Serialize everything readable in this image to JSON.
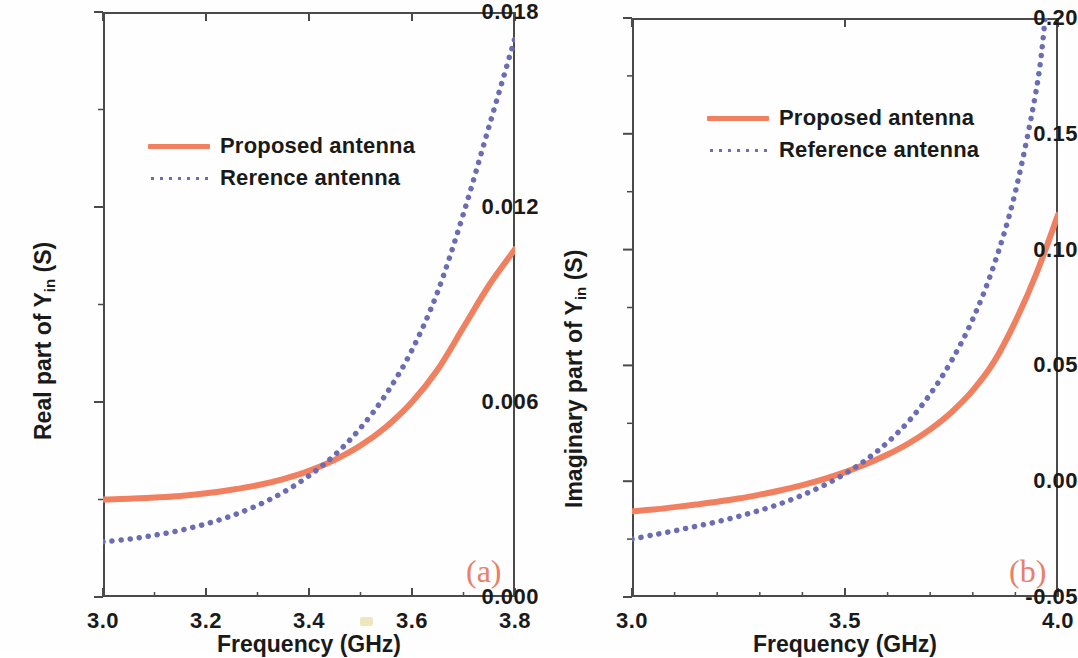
{
  "figure": {
    "background": "#ffffff",
    "series_colors": {
      "proposed": "#F0805F",
      "reference": "#6C6CB4"
    },
    "caption_color": "#E8806A"
  },
  "panels": [
    {
      "id": "a",
      "caption": "(a)",
      "legend": [
        {
          "label": "Proposed antenna",
          "style": "solid",
          "color": "#F0805F"
        },
        {
          "label": "Rerence antenna",
          "style": "dotted",
          "color": "#6C6CB4"
        }
      ]
    },
    {
      "id": "b",
      "caption": "(b)",
      "legend": [
        {
          "label": "Proposed antenna",
          "style": "solid",
          "color": "#F0805F"
        },
        {
          "label": "Reference antenna",
          "style": "dotted",
          "color": "#6C6CB4"
        }
      ]
    }
  ],
  "chart_data": [
    {
      "type": "line",
      "panel": "a",
      "title": "",
      "xlabel": "Frequency (GHz)",
      "ylabel": "Real part of Yin (S)",
      "ylabel_main": "Real part of Y",
      "ylabel_sub": "in",
      "ylabel_unit": " (S)",
      "xlim": [
        3.0,
        3.8
      ],
      "ylim": [
        0.0,
        0.018
      ],
      "xticks": [
        3.0,
        3.2,
        3.4,
        3.6,
        3.8
      ],
      "xticklabels": [
        "3.0",
        "3.2",
        "3.4",
        "3.6",
        "3.8"
      ],
      "yticks": [
        0.0,
        0.006,
        0.012,
        0.018
      ],
      "yticklabels": [
        "0.000",
        "0.006",
        "0.012",
        "0.018"
      ],
      "minor_x_per_major": 2,
      "minor_y_per_major": 2,
      "grid": false,
      "legend_position": "upper-left",
      "series": [
        {
          "name": "Proposed antenna",
          "style": "solid",
          "color": "#F0805F",
          "x": [
            3.0,
            3.05,
            3.1,
            3.15,
            3.2,
            3.25,
            3.3,
            3.35,
            3.4,
            3.45,
            3.5,
            3.55,
            3.6,
            3.65,
            3.7,
            3.75,
            3.8
          ],
          "values": [
            0.003,
            0.00302,
            0.00306,
            0.00311,
            0.00319,
            0.0033,
            0.00344,
            0.00363,
            0.00388,
            0.00422,
            0.00466,
            0.00524,
            0.006,
            0.007,
            0.0083,
            0.0096,
            0.0107
          ]
        },
        {
          "name": "Rerence antenna",
          "style": "dotted",
          "color": "#6C6CB4",
          "x": [
            3.0,
            3.05,
            3.1,
            3.15,
            3.2,
            3.25,
            3.3,
            3.35,
            3.4,
            3.45,
            3.5,
            3.55,
            3.6,
            3.65,
            3.7,
            3.75,
            3.8
          ],
          "values": [
            0.0017,
            0.00178,
            0.0019,
            0.00205,
            0.00225,
            0.0025,
            0.00282,
            0.00322,
            0.00373,
            0.00437,
            0.0052,
            0.00625,
            0.0076,
            0.0094,
            0.0118,
            0.0145,
            0.0172
          ]
        }
      ]
    },
    {
      "type": "line",
      "panel": "b",
      "title": "",
      "xlabel": "Frequency (GHz)",
      "ylabel": "Imaginary part of Yin (S)",
      "ylabel_main": "Imaginary part of Y",
      "ylabel_sub": "in",
      "ylabel_unit": " (S)",
      "xlim": [
        3.0,
        4.0
      ],
      "ylim": [
        -0.05,
        0.2
      ],
      "xticks": [
        3.0,
        3.5,
        4.0
      ],
      "xticklabels": [
        "3.0",
        "3.5",
        "4.0"
      ],
      "yticks": [
        -0.05,
        0.0,
        0.05,
        0.1,
        0.15,
        0.2
      ],
      "yticklabels": [
        "-0.05",
        "0.00",
        "0.05",
        "0.10",
        "0.15",
        "0.20"
      ],
      "minor_x_per_major": 5,
      "minor_y_per_major": 2,
      "grid": false,
      "legend_position": "upper-center",
      "series": [
        {
          "name": "Proposed antenna",
          "style": "solid",
          "color": "#F0805F",
          "x": [
            3.0,
            3.05,
            3.1,
            3.15,
            3.2,
            3.25,
            3.3,
            3.35,
            3.4,
            3.45,
            3.5,
            3.55,
            3.6,
            3.65,
            3.7,
            3.75,
            3.8,
            3.85,
            3.9,
            3.95,
            4.0
          ],
          "values": [
            -0.013,
            -0.0122,
            -0.0112,
            -0.0101,
            -0.0089,
            -0.0075,
            -0.0058,
            -0.0039,
            -0.0017,
            0.0009,
            0.0039,
            0.0074,
            0.0115,
            0.0164,
            0.0224,
            0.0298,
            0.0392,
            0.0516,
            0.069,
            0.09,
            0.115
          ]
        },
        {
          "name": "Reference antenna",
          "style": "dotted",
          "color": "#6C6CB4",
          "x": [
            3.0,
            3.05,
            3.1,
            3.15,
            3.2,
            3.25,
            3.3,
            3.35,
            3.4,
            3.45,
            3.5,
            3.55,
            3.6,
            3.65,
            3.7,
            3.75,
            3.8,
            3.85,
            3.9,
            3.95,
            3.97
          ],
          "values": [
            -0.025,
            -0.0232,
            -0.0214,
            -0.0195,
            -0.0175,
            -0.0152,
            -0.0126,
            -0.0096,
            -0.006,
            -0.0018,
            0.0032,
            0.0093,
            0.0168,
            0.026,
            0.0376,
            0.052,
            0.07,
            0.0935,
            0.125,
            0.17,
            0.2
          ]
        }
      ]
    }
  ]
}
